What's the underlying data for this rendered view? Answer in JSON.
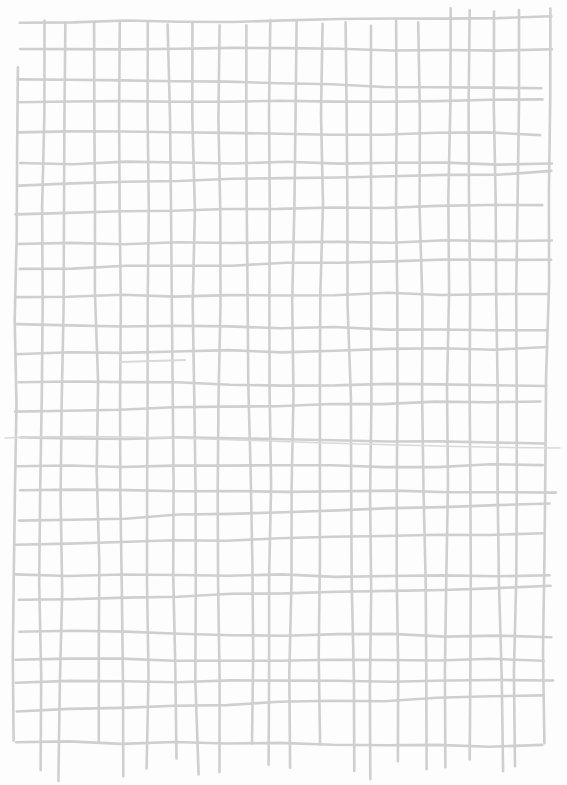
{
  "image": {
    "description": "Hand-drawn grey grid on a white sheet of paper",
    "width": 567,
    "height": 785,
    "colors": {
      "paper": "#fdfdfd",
      "line": "#cfcfcf",
      "faint_line": "#d9d9d9"
    },
    "grid": {
      "vertical_lines": 22,
      "horizontal_lines": 27,
      "left": 18,
      "right": 548,
      "top": 12,
      "bottom": 770
    }
  }
}
